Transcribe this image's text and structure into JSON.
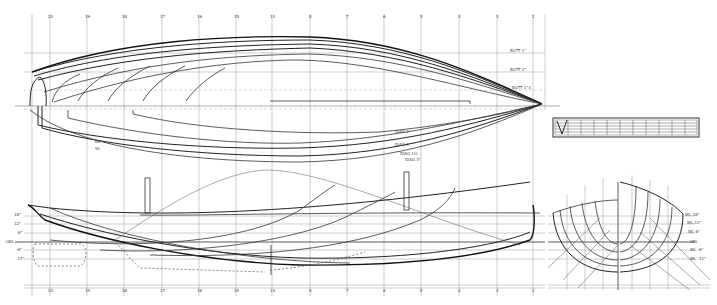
{
  "drawing": {
    "type": "boat lines plan",
    "views": [
      "half-breadth plan",
      "profile",
      "body plan",
      "scale box"
    ]
  },
  "stations": {
    "top_labels": [
      "20",
      "19",
      "18",
      "17",
      "16",
      "15",
      "14",
      "8",
      "7",
      "6",
      "5",
      "4",
      "3",
      "2",
      "1",
      "0"
    ],
    "bottom_labels": [
      "20",
      "19",
      "18",
      "17",
      "16",
      "15",
      "14",
      "8",
      "7",
      "6",
      "5",
      "4",
      "3",
      "2",
      "1",
      "0"
    ]
  },
  "half_breadth": {
    "buttock_labels": [
      "BUTT 1\"",
      "BUTT 2\"",
      "BUTT 1\"3"
    ],
    "diagonal_labels": [
      "DIAG 2",
      "DIAG 1",
      "DIAG 1½",
      "DIAG 3\""
    ],
    "waterline_labels": [
      "WL 18\"",
      "WL 12\"",
      "WL 6\"",
      "LWL",
      "WL -6\"",
      "WL -12\""
    ],
    "left_labels": [
      "Bk",
      "Sh"
    ]
  },
  "profile": {
    "waterline_labels": [
      "18\"",
      "12\"",
      "6\"",
      "LWL",
      "-6\"",
      "-12\""
    ],
    "sheer_label": "SHEER",
    "diag_labels": [
      "DIAG 3\"",
      "DIAG 2",
      "BUTT 1\"",
      "BUTT 2\"",
      "BUTT 3\""
    ]
  },
  "body_plan": {
    "buttock_labels": [
      "BUTT 3\"",
      "BUTT 2\"",
      "BUTT 1\"",
      "BUTT 1\"",
      "BUTT 2\"",
      "BUTT 3\""
    ],
    "waterline_labels": [
      "WL 18\"",
      "WL 12\"",
      "WL 6\"",
      "LWL",
      "WL -6\"",
      "WL -12\""
    ],
    "diagonal_labels": [
      "DIAG 3",
      "DIAG 2",
      "DIAG 1",
      "DIAG 1",
      "DIAG 2",
      "DIAG 3"
    ],
    "sheer_label": "SHEER"
  },
  "scale_box": {
    "divisions": 11,
    "mark": "V"
  }
}
